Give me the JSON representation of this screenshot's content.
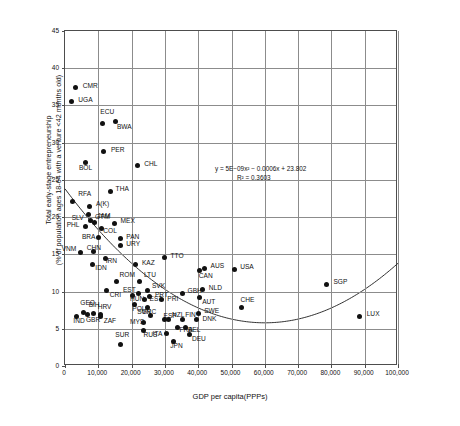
{
  "chart_data": {
    "type": "scatter",
    "title": "",
    "xlabel": "GDP per capita(PPPs)",
    "ylabel_line1": "Total early-stage entrepreneurship",
    "ylabel_line2": "(% of population ages 18-64 with a venture <42 months old)",
    "xlim": [
      0,
      100000
    ],
    "ylim": [
      0,
      45
    ],
    "xticks": [
      "0",
      "10,000",
      "20,000",
      "30,000",
      "40,000",
      "50,000",
      "60,000",
      "70,000",
      "80,000",
      "90,000",
      "100,000"
    ],
    "xtick_values": [
      0,
      10000,
      20000,
      30000,
      40000,
      50000,
      60000,
      70000,
      80000,
      90000,
      100000
    ],
    "yticks": [
      "0",
      "5",
      "10",
      "15",
      "20",
      "25",
      "30",
      "35",
      "40",
      "45"
    ],
    "ytick_values": [
      0,
      5,
      10,
      15,
      20,
      25,
      30,
      35,
      40,
      45
    ],
    "grid": true,
    "legend": "none",
    "marker_color": "#111111",
    "grid_color": "#8c8c8c",
    "trendline": {
      "type": "polynomial-order-2",
      "equation": "y = 5E−09x² − 0.0006x + 23.802",
      "equation_text": "y = 5E − 09x",
      "equation_rest": " − 0.0006x + 23.802",
      "r_squared": "R² = 0.3603",
      "a": 5e-09,
      "b": -0.0006,
      "c": 23.802
    },
    "points": [
      {
        "code": "CMR",
        "x": 3200,
        "y": 37.4,
        "lx": 7,
        "ly": -3
      },
      {
        "code": "UGA",
        "x": 1900,
        "y": 35.5,
        "lx": 7,
        "ly": -3
      },
      {
        "code": "ECU",
        "x": 11200,
        "y": 32.6,
        "lx": -2,
        "ly": -12
      },
      {
        "code": "BWA",
        "x": 15300,
        "y": 32.9,
        "lx": 1,
        "ly": 5
      },
      {
        "code": "PER",
        "x": 11700,
        "y": 28.8,
        "lx": 7,
        "ly": -3
      },
      {
        "code": "BOL",
        "x": 6300,
        "y": 27.4,
        "lx": -7,
        "ly": 5
      },
      {
        "code": "CHL",
        "x": 21700,
        "y": 26.9,
        "lx": 7,
        "ly": -3
      },
      {
        "code": "THA",
        "x": 13700,
        "y": 23.4,
        "lx": 5,
        "ly": -4
      },
      {
        "code": "RFA",
        "x": 2200,
        "y": 22.1,
        "lx": 6,
        "ly": -8
      },
      {
        "code": "A(K)",
        "x": 7500,
        "y": 21.4,
        "lx": 6,
        "ly": -4
      },
      {
        "code": "GTM",
        "x": 7200,
        "y": 20.4,
        "lx": 6,
        "ly": 2
      },
      {
        "code": "SLV",
        "x": 7700,
        "y": 19.5,
        "lx": -19,
        "ly": -4
      },
      {
        "code": "PHL",
        "x": 6200,
        "y": 18.7,
        "lx": -19,
        "ly": -3
      },
      {
        "code": "JAM",
        "x": 8800,
        "y": 19.3,
        "lx": 3,
        "ly": -7
      },
      {
        "code": "MEX",
        "x": 14900,
        "y": 19.2,
        "lx": 6,
        "ly": -3
      },
      {
        "code": "COL",
        "x": 10900,
        "y": 18.5,
        "lx": 2,
        "ly": 2
      },
      {
        "code": "BRA",
        "x": 10200,
        "y": 17.2,
        "lx": -17,
        "ly": -2
      },
      {
        "code": "PAN",
        "x": 16600,
        "y": 17.1,
        "lx": 6,
        "ly": -3
      },
      {
        "code": "URY",
        "x": 16600,
        "y": 16.2,
        "lx": 6,
        "ly": -2
      },
      {
        "code": "VNM",
        "x": 4700,
        "y": 15.3,
        "lx": -19,
        "ly": -4
      },
      {
        "code": "CHN",
        "x": 8600,
        "y": 15.4,
        "lx": -7,
        "ly": -4
      },
      {
        "code": "IRN",
        "x": 12200,
        "y": 14.5,
        "lx": 0,
        "ly": 2
      },
      {
        "code": "IDN",
        "x": 8200,
        "y": 13.7,
        "lx": 3,
        "ly": 3
      },
      {
        "code": "KAZ",
        "x": 21300,
        "y": 13.6,
        "lx": 6,
        "ly": -3
      },
      {
        "code": "TTO",
        "x": 29900,
        "y": 14.6,
        "lx": 6,
        "ly": -2
      },
      {
        "code": "AUS",
        "x": 41900,
        "y": 13.1,
        "lx": 6,
        "ly": -3
      },
      {
        "code": "CAN",
        "x": 40500,
        "y": 12.8,
        "lx": -1,
        "ly": 4
      },
      {
        "code": "USA",
        "x": 50800,
        "y": 13.0,
        "lx": 6,
        "ly": -3
      },
      {
        "code": "ROM",
        "x": 15500,
        "y": 11.3,
        "lx": 3,
        "ly": -8
      },
      {
        "code": "CRI",
        "x": 12500,
        "y": 10.1,
        "lx": 3,
        "ly": 3
      },
      {
        "code": "LTU",
        "x": 22500,
        "y": 11.3,
        "lx": 4,
        "ly": -8
      },
      {
        "code": "SVK",
        "x": 24900,
        "y": 10.2,
        "lx": 4,
        "ly": -5
      },
      {
        "code": "PRT",
        "x": 25500,
        "y": 9.3,
        "lx": 5,
        "ly": -3
      },
      {
        "code": "EST",
        "x": 22200,
        "y": 9.8,
        "lx": -16,
        "ly": -4
      },
      {
        "code": "EST2",
        "label": "EST",
        "x": 23900,
        "y": 8.9,
        "lx": 5,
        "ly": -2
      },
      {
        "code": "HUN",
        "x": 20400,
        "y": 9.5,
        "lx": -3,
        "ly": 3
      },
      {
        "code": "GBH",
        "x": 35300,
        "y": 9.8,
        "lx": 5,
        "ly": -3
      },
      {
        "code": "PRI",
        "x": 28900,
        "y": 8.9,
        "lx": 6,
        "ly": -2
      },
      {
        "code": "NLD",
        "x": 41400,
        "y": 10.3,
        "lx": 6,
        "ly": -2
      },
      {
        "code": "AUT",
        "x": 40300,
        "y": 9.2,
        "lx": 3,
        "ly": 3
      },
      {
        "code": "CHE",
        "x": 53000,
        "y": 7.8,
        "lx": -1,
        "ly": -9
      },
      {
        "code": "SGP",
        "x": 78500,
        "y": 11.0,
        "lx": 7,
        "ly": -3
      },
      {
        "code": "LUX",
        "x": 88500,
        "y": 6.7,
        "lx": 7,
        "ly": -3
      },
      {
        "code": "POL",
        "x": 20800,
        "y": 8.2,
        "lx": -2,
        "ly": 3
      },
      {
        "code": "GRC",
        "x": 24800,
        "y": 7.9,
        "lx": -6,
        "ly": 4
      },
      {
        "code": "SVN",
        "x": 25600,
        "y": 6.8,
        "lx": -13,
        "ly": -4
      },
      {
        "code": "ESP",
        "x": 29900,
        "y": 6.2,
        "lx": -1,
        "ly": -5
      },
      {
        "code": "NZL",
        "x": 31200,
        "y": 6.3,
        "lx": 3,
        "ly": -5
      },
      {
        "code": "FIN",
        "x": 35200,
        "y": 6.3,
        "lx": 3,
        "ly": -5
      },
      {
        "code": "SWE",
        "x": 40000,
        "y": 7.1,
        "lx": 6,
        "ly": -3
      },
      {
        "code": "DNK",
        "x": 39500,
        "y": 6.2,
        "lx": 6,
        "ly": -2
      },
      {
        "code": "MYS",
        "x": 23700,
        "y": 5.9,
        "lx": -14,
        "ly": -1
      },
      {
        "code": "RUS",
        "x": 23600,
        "y": 4.8,
        "lx": 0,
        "ly": 4
      },
      {
        "code": "ITA",
        "x": 30500,
        "y": 4.3,
        "lx": -14,
        "ly": -1
      },
      {
        "code": "JPN",
        "x": 32500,
        "y": 3.3,
        "lx": -3,
        "ly": 4
      },
      {
        "code": "FRA",
        "x": 33800,
        "y": 5.2,
        "lx": 2,
        "ly": 2
      },
      {
        "code": "BEL",
        "x": 36300,
        "y": 5.2,
        "lx": 2,
        "ly": 2
      },
      {
        "code": "DEU",
        "x": 37500,
        "y": 4.2,
        "lx": 2,
        "ly": 3
      },
      {
        "code": "GEO",
        "x": 5500,
        "y": 7.2,
        "lx": -3,
        "ly": -10
      },
      {
        "code": "IND",
        "x": 3400,
        "y": 6.7,
        "lx": -3,
        "ly": 4
      },
      {
        "code": "GBR",
        "x": 6900,
        "y": 6.9,
        "lx": -2,
        "ly": 4
      },
      {
        "code": "BIH",
        "x": 8600,
        "y": 7.1,
        "lx": -5,
        "ly": -9
      },
      {
        "code": "HRV",
        "x": 10700,
        "y": 6.9,
        "lx": -3,
        "ly": -9
      },
      {
        "code": "ZAF",
        "x": 10700,
        "y": 6.6,
        "lx": 3,
        "ly": 3
      },
      {
        "code": "SUR",
        "x": 16600,
        "y": 2.9,
        "lx": -5,
        "ly": -10
      }
    ]
  }
}
